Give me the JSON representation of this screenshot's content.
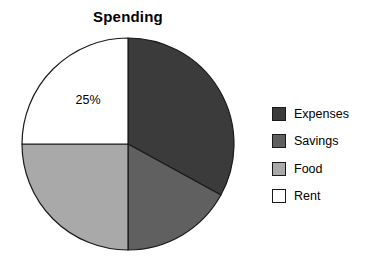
{
  "chart_data": {
    "type": "pie",
    "title": "Spending",
    "categories": [
      "Expenses",
      "Savings",
      "Food",
      "Rent"
    ],
    "values": [
      33,
      17,
      25,
      25
    ],
    "value_unit": "%",
    "data_labels": [
      {
        "category": "Rent",
        "text": "25%",
        "x": 88,
        "y": 104
      }
    ],
    "colors": [
      "#3b3b3b",
      "#606060",
      "#a9a9a9",
      "#ffffff"
    ],
    "edge_color": "#1a1a1a",
    "start_angle_deg": 90,
    "direction": "clockwise",
    "legend_position": "right",
    "grid": false,
    "xlabel": "",
    "ylabel": ""
  },
  "legend": {
    "items": [
      {
        "label": "Expenses",
        "color": "#3b3b3b"
      },
      {
        "label": "Savings",
        "color": "#606060"
      },
      {
        "label": "Food",
        "color": "#a9a9a9"
      },
      {
        "label": "Rent",
        "color": "#ffffff"
      }
    ]
  },
  "geometry": {
    "center_x": 128,
    "center_y": 144,
    "radius": 106
  }
}
